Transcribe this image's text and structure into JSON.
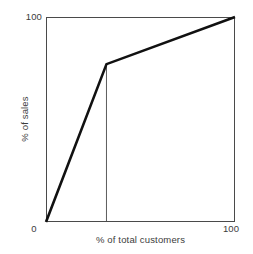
{
  "figure": {
    "caption_remnant": "",
    "background": "#ffffff",
    "line_color": "#111111",
    "axis_color": "#4a4a4a",
    "text_color": "#3c3c3c"
  },
  "chart_data": {
    "type": "line",
    "title": "",
    "subtitle": "",
    "xlabel": "% of total customers",
    "ylabel": "% of sales",
    "xlim": [
      0,
      100
    ],
    "ylim": [
      0,
      100
    ],
    "grid": false,
    "legend": null,
    "x_ticks": [
      "0",
      "100"
    ],
    "x_tick_values": [
      0,
      100
    ],
    "y_ticks": [
      "100"
    ],
    "y_tick_values": [
      100
    ],
    "series": [
      {
        "name": "Lorenz curve",
        "x": [
          0,
          32,
          100
        ],
        "y": [
          0,
          77,
          100
        ],
        "color": "#111111",
        "linewidth": 2.6
      }
    ],
    "annotations": [
      {
        "name": "elbow-dropline",
        "type": "vertical-line",
        "x": 32,
        "y_from": 0,
        "y_to": 77,
        "color": "#4a4a4a",
        "linewidth": 0.9
      }
    ]
  }
}
